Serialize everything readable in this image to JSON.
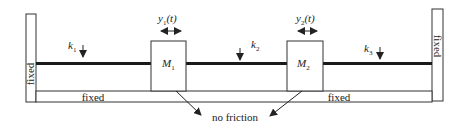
{
  "diagram": {
    "type": "two-mass spring system",
    "walls": {
      "left_label": "fixed",
      "right_label": "fixed",
      "bottom_left_label": "fixed",
      "bottom_right_label": "fixed"
    },
    "springs": [
      {
        "name": "k",
        "sub": "1"
      },
      {
        "name": "k",
        "sub": "2"
      },
      {
        "name": "k",
        "sub": "3"
      }
    ],
    "masses": [
      {
        "name": "M",
        "sub": "1",
        "displacement": {
          "var": "y",
          "sub": "1",
          "arg": "(t)"
        }
      },
      {
        "name": "M",
        "sub": "2",
        "displacement": {
          "var": "y",
          "sub": "2",
          "arg": "(t)"
        }
      }
    ],
    "annotation": "no friction",
    "colors": {
      "line": "#222222",
      "rod": "#1a1a1a",
      "background": "#ffffff"
    }
  }
}
